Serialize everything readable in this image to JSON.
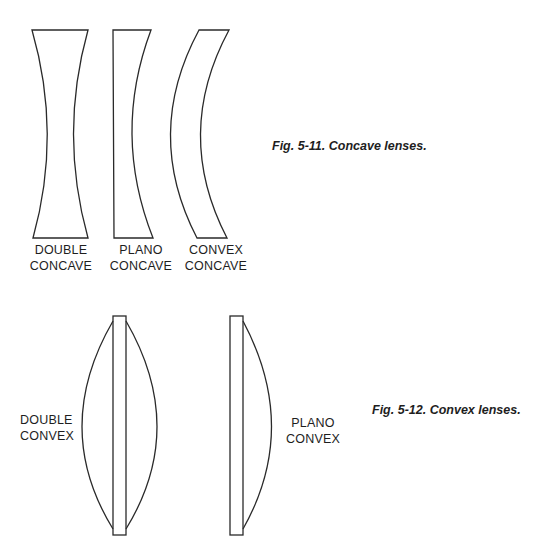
{
  "figure_5_11": {
    "caption": "Fig. 5-11. Concave lenses.",
    "lenses": [
      {
        "line1": "DOUBLE",
        "line2": "CONCAVE"
      },
      {
        "line1": "PLANO",
        "line2": "CONCAVE"
      },
      {
        "line1": "CONVEX",
        "line2": "CONCAVE"
      }
    ]
  },
  "figure_5_12": {
    "caption": "Fig. 5-12. Convex lenses.",
    "lenses": [
      {
        "line1": "DOUBLE",
        "line2": "CONVEX"
      },
      {
        "line1": "PLANO",
        "line2": "CONVEX"
      }
    ]
  },
  "colors": {
    "stroke": "#2a2a2a",
    "background": "#ffffff"
  }
}
